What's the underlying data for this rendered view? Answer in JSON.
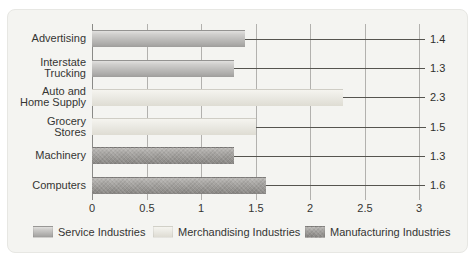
{
  "chart_data": {
    "type": "bar",
    "orientation": "horizontal",
    "title": "",
    "xlabel": "",
    "ylabel": "",
    "xlim": [
      0,
      3
    ],
    "grid": "vertical",
    "categories": [
      "Advertising",
      "Interstate Trucking",
      "Auto and Home Supply",
      "Grocery Stores",
      "Machinery",
      "Computers"
    ],
    "category_label_lines": [
      [
        "Advertising"
      ],
      [
        "Interstate",
        "Trucking"
      ],
      [
        "Auto and",
        "Home Supply"
      ],
      [
        "Grocery",
        "Stores"
      ],
      [
        "Machinery"
      ],
      [
        "Computers"
      ]
    ],
    "values": [
      1.4,
      1.3,
      2.3,
      1.5,
      1.3,
      1.6
    ],
    "value_labels": [
      "1.4",
      "1.3",
      "2.3",
      "1.5",
      "1.3",
      "1.6"
    ],
    "category_series": [
      "service",
      "service",
      "merchandising",
      "merchandising",
      "manufacturing",
      "manufacturing"
    ],
    "x_ticks": [
      {
        "value": 0,
        "label": "0"
      },
      {
        "value": 0.5,
        "label": "0.5"
      },
      {
        "value": 1,
        "label": "1"
      },
      {
        "value": 1.5,
        "label": "1.5"
      },
      {
        "value": 2,
        "label": "2"
      },
      {
        "value": 2.5,
        "label": "2.5"
      },
      {
        "value": 3,
        "label": "3"
      }
    ],
    "legend_position": "bottom",
    "legend": [
      {
        "key": "service",
        "label": "Service Industries",
        "color": "#a8a7a5"
      },
      {
        "key": "merchandising",
        "label": "Merchandising Industries",
        "color": "#e9e7e0"
      },
      {
        "key": "manufacturing",
        "label": "Manufacturing Industries",
        "color": "#918f8c"
      }
    ]
  }
}
